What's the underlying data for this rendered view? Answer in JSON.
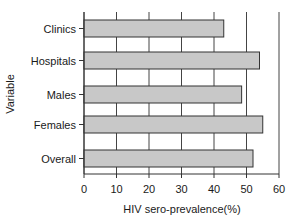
{
  "chart_data": {
    "type": "bar",
    "orientation": "horizontal",
    "title": "",
    "xlabel": "HIV sero-prevalence(%)",
    "ylabel": "Variable",
    "categories": [
      "Clinics",
      "Hospitals",
      "Males",
      "Females",
      "Overall"
    ],
    "values": [
      43,
      54,
      48.5,
      55,
      52
    ],
    "xlim": [
      0,
      60
    ],
    "xticks": [
      "0",
      "10",
      "20",
      "30",
      "40",
      "50",
      "60"
    ],
    "grid": "vertical",
    "legend": "none",
    "bar_color": "#c8c8c8",
    "bar_edge_color": "#333333"
  }
}
